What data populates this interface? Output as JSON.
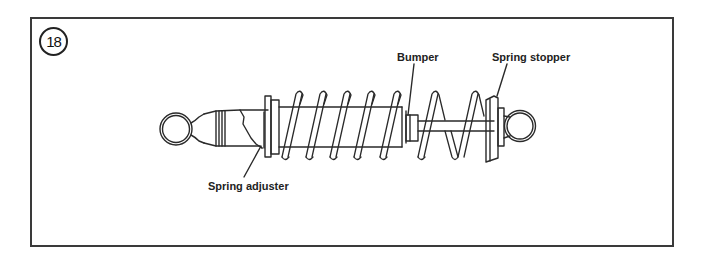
{
  "figure": {
    "number": "18"
  },
  "labels": {
    "bumper": "Bumper",
    "spring_stopper": "Spring stopper",
    "spring_adjuster": "Spring adjuster"
  },
  "colors": {
    "line": "#2a2a2a",
    "frame": "#3a3a3a",
    "background": "#ffffff"
  }
}
